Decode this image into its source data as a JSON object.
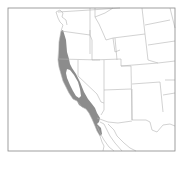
{
  "map": {
    "type": "species-range-map",
    "region": "Western United States and northern Mexico",
    "frame": {
      "x": 8,
      "y": 8,
      "width": 167,
      "height": 143
    },
    "colors": {
      "background": "#ffffff",
      "frame": "#888888",
      "borders": "#b4b4b4",
      "range_fill": "#8c8c8c"
    },
    "range_description": "Shaded distribution along Pacific coast from southern Oregon through California into northern Baja California"
  }
}
